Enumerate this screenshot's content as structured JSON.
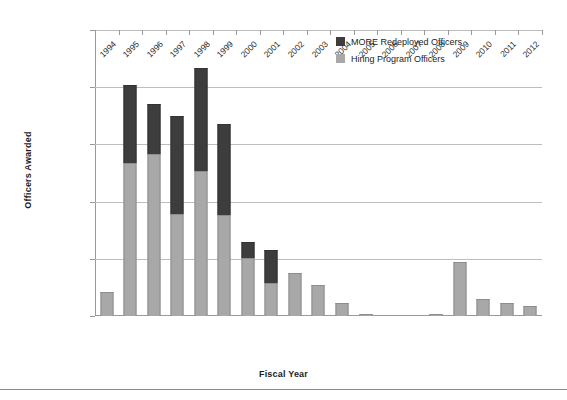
{
  "chart_data": {
    "type": "bar",
    "subtype": "stacked",
    "title": "",
    "xlabel": "Fiscal Year",
    "ylabel": "Officers Awarded",
    "ylim": [
      0,
      25000
    ],
    "ytick_values": [
      0,
      5000,
      10000,
      15000,
      20000,
      25000
    ],
    "ytick_labels": [
      "-",
      "5,000",
      "10,000",
      "15,000",
      "20,000",
      "25,000"
    ],
    "grid": true,
    "legend_position": "top-center-right",
    "categories": [
      "1994",
      "1995",
      "1996",
      "1997",
      "1998",
      "1999",
      "2000",
      "2001",
      "2002",
      "2003",
      "2004",
      "2005",
      "2006",
      "2007",
      "2008",
      "2009",
      "2010",
      "2011",
      "2012"
    ],
    "series": [
      {
        "name": "Hiring Program Officers",
        "color": "#a8a8a8",
        "values": [
          2100,
          13400,
          14200,
          8900,
          12700,
          8800,
          5100,
          2900,
          3800,
          2700,
          1150,
          200,
          0,
          0,
          200,
          4750,
          1500,
          1150,
          900
        ]
      },
      {
        "name": "MORE Redeployed Officers",
        "color": "#3d3d3d",
        "values": [
          0,
          6800,
          4300,
          8600,
          9000,
          8000,
          1400,
          2900,
          0,
          0,
          0,
          0,
          0,
          0,
          0,
          0,
          0,
          0,
          0
        ]
      }
    ],
    "totals": [
      2100,
      20200,
      18500,
      17500,
      21700,
      16800,
      6500,
      5800,
      3800,
      2700,
      1150,
      200,
      0,
      0,
      200,
      4750,
      1500,
      1150,
      900
    ]
  },
  "legend": {
    "items": [
      {
        "label": "MORE Redeployed Officers",
        "swatch": "dark"
      },
      {
        "label": "Hiring Program Officers",
        "swatch": "light"
      }
    ]
  }
}
